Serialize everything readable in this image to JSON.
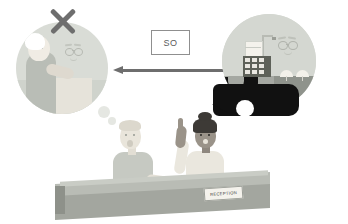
{
  "illustration": {
    "title": "Hotel reception refusal scenario",
    "label_box": {
      "text": "SO",
      "border_color": "#8f8f8f",
      "text_color": "#5a5a5a"
    }
  },
  "left_scene": {
    "name": "refused-memory-circle",
    "marker": "x-mark",
    "marker_color": "#6e6e6e",
    "circle_color": "#d9dcd6",
    "elements": [
      {
        "name": "elderly-guest",
        "color": "#b9bdb6"
      },
      {
        "name": "receptionist-face",
        "color": "#c3c6bf"
      },
      {
        "name": "counter",
        "color": "#e6e3da"
      }
    ]
  },
  "arrow": {
    "name": "leftward-arrow",
    "direction": "left",
    "color": "#6e6e6e"
  },
  "right_scene": {
    "name": "hotel-seaside-circle",
    "circle_color": "#d4d7d1",
    "sea_color": "#8f938c",
    "road_color": "#a5a8a2",
    "elements": [
      {
        "name": "hotel-building",
        "color": "#5e6159"
      },
      {
        "name": "flag-mast",
        "color": "#b8bbb4"
      },
      {
        "name": "beach-umbrella",
        "color": "#f3f1ea"
      },
      {
        "name": "vehicle",
        "color": "#111111"
      },
      {
        "name": "guest-face",
        "color": "#bec1ba"
      }
    ]
  },
  "characters": {
    "guest": {
      "name": "standing-guest",
      "shirt_color": "#c6c9c2",
      "skin_color": "#e9e5db"
    },
    "receptionist": {
      "name": "receptionist-woman",
      "shirt_color": "#eae7de",
      "skin_color": "#9a9389",
      "hair_color": "#3d3a36"
    }
  },
  "speech_bubble": {
    "name": "receptionist-speech-bubble",
    "color": "#111111"
  },
  "thought_bubble": {
    "name": "guest-thought-bubble",
    "color": "#e5e7e2"
  },
  "desk": {
    "name": "reception-desk",
    "color": "#a3a69f",
    "sign": {
      "text": "RECEPTION",
      "background": "#f4f2ec",
      "text_color": "#3a3a3a"
    }
  }
}
